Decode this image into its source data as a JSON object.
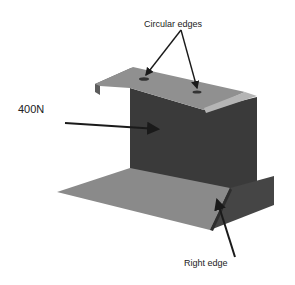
{
  "labels": {
    "circular_edges": "Circular edges",
    "force": "400N",
    "right_edge": "Right edge"
  },
  "colors": {
    "top_plate": "#8f8f8f",
    "top_lip": "#5c5c5c",
    "wall": "#3a3a3a",
    "bottom_plate": "#8a8a8a",
    "right_flange": "#444444",
    "arrow": "#1a1a1a"
  }
}
